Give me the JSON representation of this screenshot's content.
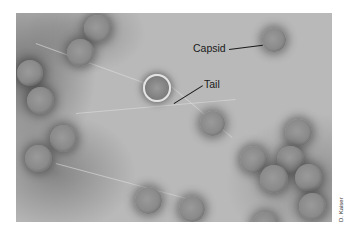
{
  "figure": {
    "labels": {
      "capsid": "Capsid",
      "tail": "Tail"
    },
    "credit": "D. Kaiser"
  }
}
